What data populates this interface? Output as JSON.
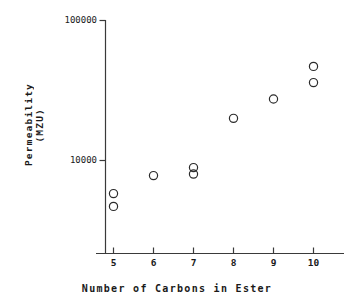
{
  "chart_data": {
    "type": "scatter",
    "title": "",
    "xlabel": "Number of Carbons in Ester",
    "ylabel": "Permeability\n(MZU)",
    "ylabel_lines": [
      "Permeability",
      "(MZU)"
    ],
    "yscale": "log",
    "xscale": "linear",
    "xlim": [
      4.5,
      10.8
    ],
    "ylim": [
      2600,
      100000
    ],
    "grid": false,
    "legend": false,
    "xticks": [
      5,
      6,
      7,
      8,
      9,
      10
    ],
    "xtick_labels": [
      "5",
      "6",
      "7",
      "8",
      "9",
      "10"
    ],
    "yticks": [
      10000,
      100000
    ],
    "ytick_labels": [
      "10000",
      "100000"
    ],
    "marker": "open-circle",
    "marker_color": "#2b2b2b",
    "points": [
      {
        "x": 5,
        "y": 5800
      },
      {
        "x": 5,
        "y": 4700
      },
      {
        "x": 6,
        "y": 7800
      },
      {
        "x": 7,
        "y": 8900
      },
      {
        "x": 7,
        "y": 8000
      },
      {
        "x": 8,
        "y": 20000
      },
      {
        "x": 9,
        "y": 27500
      },
      {
        "x": 10,
        "y": 47000
      },
      {
        "x": 10,
        "y": 36000
      }
    ],
    "series": [
      {
        "name": "Permeability vs carbon number",
        "x": [
          5,
          5,
          6,
          7,
          7,
          8,
          9,
          10,
          10
        ],
        "values": [
          5800,
          4700,
          7800,
          8900,
          8000,
          20000,
          27500,
          47000,
          36000
        ]
      }
    ]
  },
  "axes": {
    "y_title_line1": "Permeability",
    "y_title_line2": "(MZU)",
    "x_title": "Number of Carbons in Ester",
    "y_tick_top": "100000",
    "y_tick_mid": "10000",
    "x_tick_5": "5",
    "x_tick_6": "6",
    "x_tick_7": "7",
    "x_tick_8": "8",
    "x_tick_9": "9",
    "x_tick_10": "10"
  },
  "colors": {
    "ink": "#1a1a1a",
    "axis": "#3a3a3a",
    "marker": "#2b2b2b",
    "background": "#ffffff"
  }
}
